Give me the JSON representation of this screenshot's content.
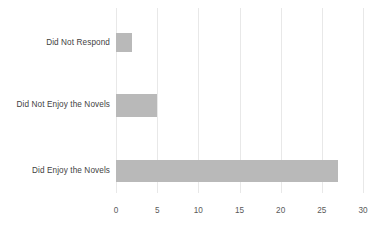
{
  "chart_data": {
    "type": "bar",
    "orientation": "horizontal",
    "title": "",
    "subtitle": "",
    "xlabel": "",
    "ylabel": "",
    "categories": [
      "Did Not Respond",
      "Did Not Enjoy the Novels",
      "Did Enjoy the Novels"
    ],
    "values": [
      2,
      5,
      27
    ],
    "series": [
      {
        "name": "Responses",
        "values": [
          2,
          5,
          27
        ]
      }
    ],
    "xlim": [
      0,
      30
    ],
    "xticks": [
      0,
      5,
      10,
      15,
      20,
      25,
      30
    ],
    "xtick_labels": [
      "0",
      "5",
      "10",
      "15",
      "20",
      "25",
      "30"
    ],
    "grid": true,
    "grid_axis": "x",
    "legend": false,
    "legend_position": "none",
    "bar_color": "#b9b9b9",
    "gridline_color": "#e8e8e8",
    "label_color": "#3f3f3f",
    "tick_color": "#5a5a5a",
    "background_color": "#ffffff"
  },
  "bars": [
    {
      "label": "Did Not Respond",
      "value": 2,
      "top": 25,
      "height": 19
    },
    {
      "label": "Did Not Enjoy the Novels",
      "value": 5,
      "top": 86,
      "height": 23
    },
    {
      "label": "Did Enjoy the Novels",
      "value": 27,
      "top": 152,
      "height": 22
    }
  ]
}
